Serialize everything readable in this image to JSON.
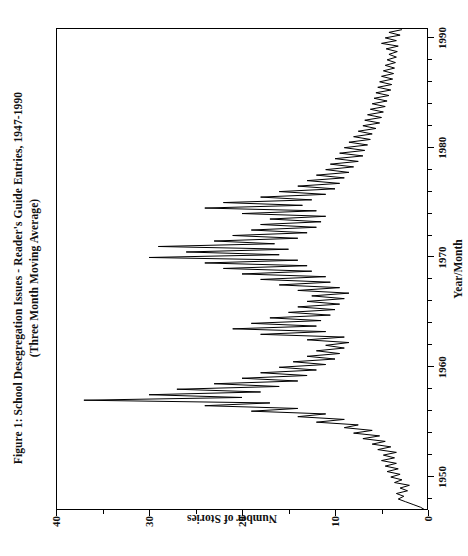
{
  "figure": {
    "title_line1": "Figure 1: School Desegregation Issues - Reader's Guide Entries, 1947-1990",
    "title_line2": "(Three Month Moving Average)",
    "orientation": "rotated-90-ccw",
    "line_color": "#000000",
    "background": "#ffffff"
  },
  "chart_data": {
    "type": "line",
    "title": "Figure 1: School Desegregation Issues - Reader's Guide Entries, 1947-1990 (Three Month Moving Average)",
    "xlabel": "Year/Month",
    "ylabel": "Number of Stories",
    "xlim": [
      1947.0,
      1990.9
    ],
    "ylim": [
      0,
      40
    ],
    "xticks": [
      1950,
      1960,
      1970,
      1980,
      1990
    ],
    "xtick_labels": [
      "1950",
      "1960",
      "1970",
      "1980",
      "1990"
    ],
    "x_minor_tick_interval": 2,
    "yticks": [
      0,
      10,
      20,
      30,
      40
    ],
    "ytick_labels": [
      "0",
      "10",
      "20",
      "30",
      "40"
    ],
    "y_minor_tick_interval": 5,
    "grid": false,
    "legend": null,
    "series": [
      {
        "name": "School desegregation stories (3-month moving average)",
        "color": "#000000",
        "x": [
          1947.0,
          1947.25,
          1947.5,
          1947.75,
          1948.0,
          1948.25,
          1948.5,
          1948.75,
          1949.0,
          1949.25,
          1949.5,
          1949.75,
          1950.0,
          1950.25,
          1950.5,
          1950.75,
          1951.0,
          1951.25,
          1951.5,
          1951.75,
          1952.0,
          1952.25,
          1952.5,
          1952.75,
          1953.0,
          1953.25,
          1953.5,
          1953.75,
          1954.0,
          1954.25,
          1954.5,
          1954.75,
          1955.0,
          1955.25,
          1955.5,
          1955.75,
          1956.0,
          1956.25,
          1956.5,
          1956.75,
          1957.0,
          1957.25,
          1957.5,
          1957.75,
          1958.0,
          1958.25,
          1958.5,
          1958.75,
          1959.0,
          1959.25,
          1959.5,
          1959.75,
          1960.0,
          1960.25,
          1960.5,
          1960.75,
          1961.0,
          1961.25,
          1961.5,
          1961.75,
          1962.0,
          1962.25,
          1962.5,
          1962.75,
          1963.0,
          1963.25,
          1963.5,
          1963.75,
          1964.0,
          1964.25,
          1964.5,
          1964.75,
          1965.0,
          1965.25,
          1965.5,
          1965.75,
          1966.0,
          1966.25,
          1966.5,
          1966.75,
          1967.0,
          1967.25,
          1967.5,
          1967.75,
          1968.0,
          1968.25,
          1968.5,
          1968.75,
          1969.0,
          1969.25,
          1969.5,
          1969.75,
          1970.0,
          1970.25,
          1970.5,
          1970.75,
          1971.0,
          1971.25,
          1971.5,
          1971.75,
          1972.0,
          1972.25,
          1972.5,
          1972.75,
          1973.0,
          1973.25,
          1973.5,
          1973.75,
          1974.0,
          1974.25,
          1974.5,
          1974.75,
          1975.0,
          1975.25,
          1975.5,
          1975.75,
          1976.0,
          1976.25,
          1976.5,
          1976.75,
          1977.0,
          1977.25,
          1977.5,
          1977.75,
          1978.0,
          1978.25,
          1978.5,
          1978.75,
          1979.0,
          1979.25,
          1979.5,
          1979.75,
          1980.0,
          1980.25,
          1980.5,
          1980.75,
          1981.0,
          1981.25,
          1981.5,
          1981.75,
          1982.0,
          1982.25,
          1982.5,
          1982.75,
          1983.0,
          1983.25,
          1983.5,
          1983.75,
          1984.0,
          1984.25,
          1984.5,
          1984.75,
          1985.0,
          1985.25,
          1985.5,
          1985.75,
          1986.0,
          1986.25,
          1986.5,
          1986.75,
          1987.0,
          1987.25,
          1987.5,
          1987.75,
          1988.0,
          1988.25,
          1988.5,
          1988.75,
          1989.0,
          1989.25,
          1989.5,
          1989.75,
          1990.0,
          1990.25,
          1990.5,
          1990.75
        ],
        "y": [
          0.3,
          0.8,
          1.6,
          2.4,
          3.2,
          2.6,
          3.4,
          2.2,
          3.0,
          2.0,
          3.6,
          2.8,
          4.0,
          3.0,
          4.4,
          3.2,
          4.6,
          3.4,
          5.0,
          3.6,
          4.8,
          3.4,
          5.4,
          4.0,
          6.0,
          4.6,
          7.0,
          5.2,
          8.0,
          6.0,
          9.0,
          7.5,
          12.0,
          9.0,
          14.0,
          11.0,
          19.0,
          14.0,
          24.0,
          17.0,
          37.0,
          20.0,
          30.0,
          18.0,
          27.0,
          16.0,
          23.0,
          14.0,
          20.0,
          13.0,
          18.0,
          12.0,
          16.0,
          11.0,
          14.5,
          10.0,
          13.0,
          9.5,
          12.0,
          9.0,
          11.0,
          8.5,
          13.0,
          9.0,
          18.0,
          11.0,
          21.0,
          12.0,
          19.0,
          11.5,
          17.0,
          10.5,
          15.0,
          10.0,
          14.0,
          9.5,
          13.0,
          9.0,
          12.5,
          8.5,
          14.0,
          9.5,
          16.0,
          10.5,
          18.0,
          11.0,
          20.0,
          12.5,
          22.0,
          13.0,
          24.0,
          14.0,
          30.0,
          16.0,
          26.0,
          15.0,
          29.0,
          16.5,
          23.0,
          14.0,
          21.0,
          13.0,
          19.0,
          12.0,
          18.0,
          11.5,
          17.0,
          11.0,
          20.0,
          12.0,
          24.0,
          13.5,
          22.0,
          12.5,
          18.0,
          11.0,
          16.0,
          10.0,
          14.0,
          9.5,
          13.0,
          9.0,
          12.0,
          8.5,
          11.0,
          8.0,
          10.5,
          7.5,
          10.0,
          7.0,
          9.5,
          6.8,
          9.0,
          6.5,
          8.5,
          6.2,
          8.0,
          6.0,
          7.5,
          5.6,
          7.0,
          5.2,
          6.8,
          5.0,
          6.5,
          4.8,
          6.2,
          4.6,
          6.0,
          4.4,
          5.8,
          4.2,
          5.6,
          4.0,
          5.4,
          3.9,
          5.2,
          3.8,
          5.0,
          3.7,
          4.8,
          3.6,
          4.6,
          3.5,
          4.4,
          3.4,
          4.2,
          3.3,
          4.5,
          3.2,
          5.0,
          3.4,
          4.6,
          3.0,
          4.2,
          2.8
        ]
      }
    ],
    "annotations": [
      {
        "text": "peak ~37 stories",
        "x": 1957.0,
        "y": 37
      },
      {
        "text": "secondary peak ~30 stories",
        "x": 1970.0,
        "y": 30
      },
      {
        "text": "secondary peak ~29 stories",
        "x": 1971.0,
        "y": 29
      }
    ]
  },
  "axes": {
    "x_title": "Year/Month",
    "y_title": "Number of Stories"
  }
}
